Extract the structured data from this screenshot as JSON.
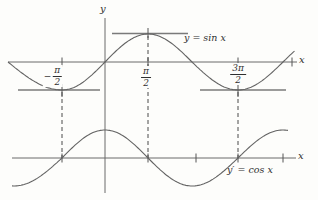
{
  "figure": {
    "background": "#fdfdfb",
    "axis_color": "#6b6b6b",
    "curve_color": "#636363",
    "tangent_color": "#7a7a7a",
    "dash_color": "#4a4a4a",
    "text_color": "#2f2f2f",
    "top_graph": {
      "y_axis_label": "y",
      "x_axis_label": "x",
      "curve_label": "y = sin x",
      "tick_fractions": [
        {
          "prefix": "−",
          "numerator": "π",
          "denominator": "2"
        },
        {
          "prefix": "",
          "numerator": "π",
          "denominator": "2"
        },
        {
          "prefix": "",
          "numerator": "3π",
          "denominator": "2"
        }
      ]
    },
    "bottom_graph": {
      "x_axis_label": "x",
      "curve_label": "y′ = cos x"
    }
  },
  "chart_data": [
    {
      "type": "line",
      "title": "y = sin x",
      "x_ticks_labels": [
        "-π/2",
        "π/2",
        "3π/2"
      ],
      "x_domain_in_pi": [
        -1,
        2.1
      ],
      "key_points_in_pi": [
        [
          -0.5,
          -1
        ],
        [
          0,
          0
        ],
        [
          0.5,
          1
        ],
        [
          1,
          0
        ],
        [
          1.5,
          -1
        ],
        [
          2,
          0
        ]
      ],
      "annotations": [
        "horizontal tangent lines at extrema"
      ]
    },
    {
      "type": "line",
      "title": "y′ = cos x",
      "x_domain_in_pi": [
        -1,
        2.1
      ],
      "key_points_in_pi": [
        [
          -0.5,
          0
        ],
        [
          0,
          1
        ],
        [
          0.5,
          0
        ],
        [
          1,
          -1
        ],
        [
          1.5,
          0
        ],
        [
          2,
          1
        ]
      ],
      "annotations": [
        "dashed verticals at -π/2, π/2, 3π/2 linking both graphs"
      ]
    }
  ]
}
